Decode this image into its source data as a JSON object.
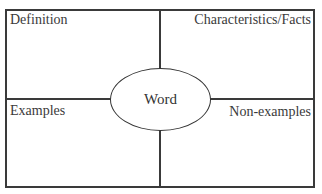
{
  "diagram": {
    "type": "frayer-model",
    "center": {
      "label": "Word"
    },
    "quadrants": {
      "top_left": {
        "label": "Definition"
      },
      "top_right": {
        "label": "Characteristics/Facts"
      },
      "bottom_left": {
        "label": "Examples"
      },
      "bottom_right": {
        "label": "Non-examples"
      }
    },
    "colors": {
      "line": "#3a3a3a",
      "text": "#333333",
      "background": "#ffffff"
    }
  }
}
